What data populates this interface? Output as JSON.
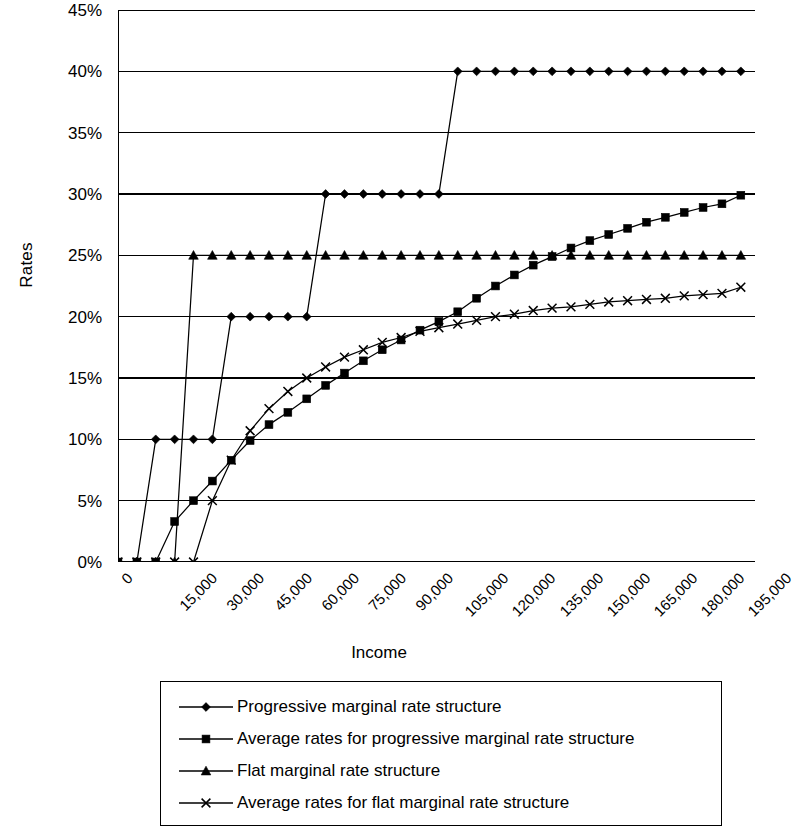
{
  "chart": {
    "type": "line",
    "ylabel": "Rates",
    "xlabel": "Income",
    "y_ticks": [
      "0%",
      "5%",
      "10%",
      "15%",
      "20%",
      "25%",
      "30%",
      "35%",
      "40%",
      "45%"
    ],
    "x_ticks": [
      "0",
      "15,000",
      "30,000",
      "45,000",
      "60,000",
      "75,000",
      "90,000",
      "105,000",
      "120,000",
      "135,000",
      "150,000",
      "165,000",
      "180,000",
      "195,000"
    ],
    "legend": [
      {
        "marker": "diamond",
        "label": "Progressive marginal rate structure"
      },
      {
        "marker": "square",
        "label": "Average rates for progressive marginal rate structure"
      },
      {
        "marker": "triangle",
        "label": "Flat marginal rate structure"
      },
      {
        "marker": "x",
        "label": "Average rates for flat marginal rate structure"
      }
    ]
  },
  "chart_data": {
    "type": "line",
    "title": "",
    "xlabel": "Income",
    "ylabel": "Rates",
    "xlim": [
      0,
      202500
    ],
    "ylim": [
      0,
      45
    ],
    "y_tick_values": [
      0,
      5,
      10,
      15,
      20,
      25,
      30,
      35,
      40,
      45
    ],
    "y_tick_labels": [
      "0%",
      "5%",
      "10%",
      "15%",
      "20%",
      "25%",
      "30%",
      "35%",
      "40%",
      "45%"
    ],
    "x_tick_values": [
      0,
      15000,
      30000,
      45000,
      60000,
      75000,
      90000,
      105000,
      120000,
      135000,
      150000,
      165000,
      180000,
      195000
    ],
    "x_tick_labels": [
      "0",
      "15,000",
      "30,000",
      "45,000",
      "60,000",
      "75,000",
      "90,000",
      "105,000",
      "120,000",
      "135,000",
      "150,000",
      "165,000",
      "180,000",
      "195,000"
    ],
    "grid": "horizontal",
    "legend_position": "below",
    "x": [
      0,
      6000,
      12000,
      18000,
      24000,
      30000,
      36000,
      42000,
      48000,
      54000,
      60000,
      66000,
      72000,
      78000,
      84000,
      90000,
      96000,
      102000,
      108000,
      114000,
      120000,
      126000,
      132000,
      138000,
      144000,
      150000,
      156000,
      162000,
      168000,
      174000,
      180000,
      186000,
      192000,
      198000
    ],
    "series": [
      {
        "name": "Progressive marginal rate structure",
        "marker": "diamond",
        "values": [
          0,
          0,
          10,
          10,
          10,
          10,
          20,
          20,
          20,
          20,
          20,
          30,
          30,
          30,
          30,
          30,
          30,
          30,
          40,
          40,
          40,
          40,
          40,
          40,
          40,
          40,
          40,
          40,
          40,
          40,
          40,
          40,
          40,
          40
        ]
      },
      {
        "name": "Average rates for progressive marginal rate structure",
        "marker": "square",
        "values": [
          0,
          0,
          0,
          3.3,
          5.0,
          6.6,
          8.3,
          9.9,
          11.2,
          12.2,
          13.3,
          14.4,
          15.4,
          16.4,
          17.3,
          18.1,
          18.9,
          19.6,
          20.4,
          21.5,
          22.5,
          23.4,
          24.2,
          24.9,
          25.6,
          26.2,
          26.7,
          27.2,
          27.7,
          28.1,
          28.5,
          28.9,
          29.2,
          29.9
        ]
      },
      {
        "name": "Flat marginal rate structure",
        "marker": "triangle",
        "values": [
          0,
          0,
          0,
          0,
          25,
          25,
          25,
          25,
          25,
          25,
          25,
          25,
          25,
          25,
          25,
          25,
          25,
          25,
          25,
          25,
          25,
          25,
          25,
          25,
          25,
          25,
          25,
          25,
          25,
          25,
          25,
          25,
          25,
          25
        ]
      },
      {
        "name": "Average rates for flat marginal rate structure",
        "marker": "x",
        "values": [
          0,
          0,
          0,
          0,
          0,
          5.0,
          8.3,
          10.7,
          12.5,
          13.9,
          15.0,
          15.9,
          16.7,
          17.3,
          17.9,
          18.3,
          18.8,
          19.1,
          19.4,
          19.7,
          20.0,
          20.2,
          20.5,
          20.7,
          20.8,
          21.0,
          21.2,
          21.3,
          21.4,
          21.5,
          21.7,
          21.8,
          21.9,
          22.4
        ]
      }
    ]
  }
}
